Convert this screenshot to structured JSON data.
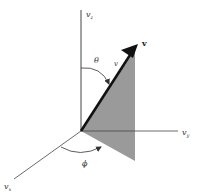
{
  "diagram": {
    "type": "3d-vector-spherical-coordinates",
    "colors": {
      "axis": "#444444",
      "vector": "#111111",
      "shade": "#9a9a9a",
      "background": "#ffffff"
    },
    "axes": {
      "z": {
        "label": "v",
        "subscript": "z"
      },
      "y": {
        "label": "v",
        "subscript": "y"
      },
      "x": {
        "label": "v",
        "subscript": "x"
      }
    },
    "vector": {
      "head_label": "v",
      "magnitude_label": "v"
    },
    "angles": {
      "polar": "θ",
      "azimuthal": "ϕ"
    }
  }
}
